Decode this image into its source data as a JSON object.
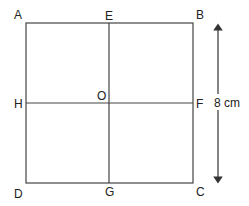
{
  "diagram": {
    "type": "square-with-midlines",
    "points": {
      "A": "A",
      "B": "B",
      "C": "C",
      "D": "D",
      "E": "E",
      "F": "F",
      "G": "G",
      "H": "H",
      "O": "O"
    },
    "dimension": {
      "label": "8 cm",
      "side": "BC"
    },
    "colors": {
      "line": "#444444",
      "text": "#222222"
    }
  }
}
